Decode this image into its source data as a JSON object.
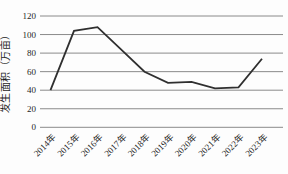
{
  "figure": {
    "background": "#fdfdfd"
  },
  "chart_data": {
    "type": "line",
    "title": "",
    "xlabel": "",
    "ylabel": "发生面积（万亩）",
    "categories": [
      "2014年",
      "2015年",
      "2016年",
      "2017年",
      "2018年",
      "2019年",
      "2020年",
      "2021年",
      "2022年",
      "2023年"
    ],
    "values": [
      40,
      104,
      108,
      84,
      60,
      48,
      49,
      42,
      43,
      74
    ],
    "ylim": [
      0,
      120
    ],
    "yticks": [
      0,
      20,
      40,
      60,
      80,
      100,
      120
    ],
    "grid": "horizontal",
    "legend_position": "none",
    "line_color": "#2f2f2f",
    "grid_color": "#8a8a8a",
    "text_color": "#1f1f1f"
  }
}
